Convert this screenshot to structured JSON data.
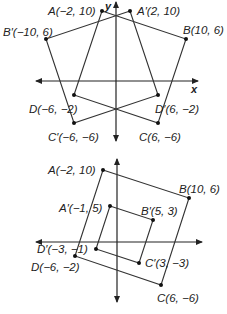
{
  "diagram1": {
    "axis_labels": {
      "x": "x",
      "y": "y"
    },
    "original": {
      "A": {
        "label": "A(−2, 10)",
        "x": -2,
        "y": 10
      },
      "B": {
        "label": "B(10, 6)",
        "x": 10,
        "y": 6
      },
      "C": {
        "label": "C(6, −6)",
        "x": 6,
        "y": -6
      },
      "D": {
        "label": "D(−6, −2)",
        "x": -6,
        "y": -2
      }
    },
    "image": {
      "A": {
        "label": "A′(2, 10)",
        "x": 2,
        "y": 10
      },
      "B": {
        "label": "B′(−10, 6)",
        "x": -10,
        "y": 6
      },
      "C": {
        "label": "C′(−6, −6)",
        "x": -6,
        "y": -6
      },
      "D": {
        "label": "D′(6, −2)",
        "x": 6,
        "y": -2
      }
    }
  },
  "diagram2": {
    "original": {
      "A": {
        "label": "A(−2, 10)",
        "x": -2,
        "y": 10
      },
      "B": {
        "label": "B(10, 6)",
        "x": 10,
        "y": 6
      },
      "C": {
        "label": "C(6, −6)",
        "x": 6,
        "y": -6
      },
      "D": {
        "label": "D(−6, −2)",
        "x": -6,
        "y": -2
      }
    },
    "image": {
      "A": {
        "label": "A′(−1, 5)",
        "x": -1,
        "y": 5
      },
      "B": {
        "label": "B′(5, 3)",
        "x": 5,
        "y": 3
      },
      "C": {
        "label": "C′(3, −3)",
        "x": 3,
        "y": -3
      },
      "D": {
        "label": "D′(−3, −1)",
        "x": -3,
        "y": -1
      }
    }
  }
}
